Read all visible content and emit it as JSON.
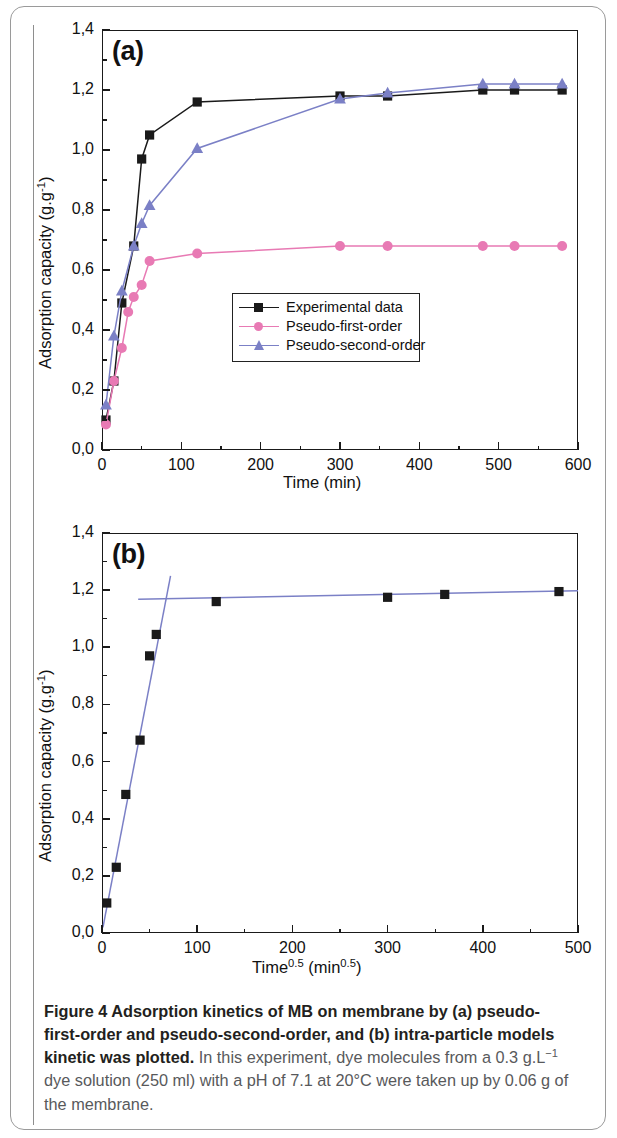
{
  "figure": {
    "caption_lead": "Figure 4 Adsorption kinetics of MB on membrane by (a) pseudo-first-order and pseudo-second-order, and (b) intra-particle models kinetic was plotted.",
    "caption_body_1": " In this experiment, dye molecules from a 0.3 g.L",
    "caption_sup_1": "−1",
    "caption_body_2": " dye solution (250 ml) with a pH of 7.1 at 20°C were taken up by 0.06 g of the membrane."
  },
  "colors": {
    "experimental": "#1a1a1a",
    "pseudo_first_order": "#e87ab4",
    "pseudo_second_order": "#7b80c6",
    "axis": "#1a1a1a",
    "caption_body": "#58595b",
    "caption_lead": "#231f20"
  },
  "chart_data": [
    {
      "type": "line",
      "panel": "(a)",
      "title": "",
      "xlabel": "Time (min)",
      "ylabel": "Adsorption capacity (g.g⁻¹)",
      "ylabel_base": "Adsorption capacity (g.g",
      "ylabel_sup": "-1",
      "ylabel_tail": ")",
      "xlim": [
        0,
        600
      ],
      "ylim": [
        0.0,
        1.4
      ],
      "xticks": [
        0,
        100,
        200,
        300,
        400,
        500,
        600
      ],
      "xticklabels": [
        "0",
        "100",
        "200",
        "300",
        "400",
        "500",
        "600"
      ],
      "yticks": [
        0.0,
        0.2,
        0.4,
        0.6,
        0.8,
        1.0,
        1.2,
        1.4
      ],
      "yticklabels": [
        "0,0",
        "0,2",
        "0,4",
        "0,6",
        "0,8",
        "1,0",
        "1,2",
        "1,4"
      ],
      "minor_ticks": true,
      "grid": false,
      "legend_position": "lower-center",
      "series": [
        {
          "name": "Experimental data",
          "marker": "square",
          "color": "#1a1a1a",
          "x": [
            5,
            15,
            25,
            40,
            50,
            60,
            120,
            300,
            360,
            480,
            520,
            580
          ],
          "y": [
            0.1,
            0.23,
            0.49,
            0.68,
            0.97,
            1.05,
            1.16,
            1.18,
            1.18,
            1.2,
            1.2,
            1.2
          ]
        },
        {
          "name": "Pseudo-first-order",
          "marker": "circle",
          "color": "#e87ab4",
          "x": [
            5,
            15,
            25,
            33,
            40,
            50,
            60,
            120,
            300,
            360,
            480,
            520,
            580
          ],
          "y": [
            0.085,
            0.23,
            0.34,
            0.46,
            0.51,
            0.55,
            0.63,
            0.655,
            0.68,
            0.68,
            0.68,
            0.68,
            0.68
          ]
        },
        {
          "name": "Pseudo-second-order",
          "marker": "triangle",
          "color": "#7b80c6",
          "x": [
            5,
            15,
            25,
            40,
            50,
            60,
            120,
            300,
            360,
            480,
            520,
            580
          ],
          "y": [
            0.15,
            0.38,
            0.53,
            0.68,
            0.755,
            0.815,
            1.005,
            1.17,
            1.19,
            1.22,
            1.22,
            1.22
          ]
        }
      ]
    },
    {
      "type": "scatter",
      "panel": "(b)",
      "title": "",
      "xlabel": "Time0.5 (min0.5)",
      "xlabel_base": "Time",
      "xlabel_sup1": "0.5",
      "xlabel_mid": " (min",
      "xlabel_sup2": "0.5",
      "xlabel_tail": ")",
      "ylabel": "Adsorption capacity (g.g⁻¹)",
      "ylabel_base": "Adsorption capacity (g.g",
      "ylabel_sup": "-1",
      "ylabel_tail": ")",
      "xlim": [
        0,
        500
      ],
      "ylim": [
        0.0,
        1.4
      ],
      "xticks": [
        0,
        100,
        200,
        300,
        400,
        500
      ],
      "xticklabels": [
        "0",
        "100",
        "200",
        "300",
        "400",
        "500"
      ],
      "yticks": [
        0.0,
        0.2,
        0.4,
        0.6,
        0.8,
        1.0,
        1.2,
        1.4
      ],
      "yticklabels": [
        "0,0",
        "0,2",
        "0,4",
        "0,6",
        "0,8",
        "1,0",
        "1,2",
        "1,4"
      ],
      "minor_ticks": true,
      "grid": false,
      "legend_position": "none",
      "series": [
        {
          "name": "Experimental data",
          "marker": "square",
          "color": "#1a1a1a",
          "x": [
            5,
            15,
            25,
            40,
            50,
            57,
            120,
            300,
            360,
            480
          ],
          "y": [
            0.105,
            0.23,
            0.485,
            0.675,
            0.97,
            1.045,
            1.16,
            1.175,
            1.185,
            1.195
          ]
        }
      ],
      "fit_lines": [
        {
          "name": "intra-particle-first-stage",
          "color": "#7b80c6",
          "x": [
            1,
            72
          ],
          "y": [
            0.02,
            1.25
          ]
        },
        {
          "name": "intra-particle-second-stage",
          "color": "#7b80c6",
          "x": [
            38,
            500
          ],
          "y": [
            1.168,
            1.198
          ]
        }
      ]
    }
  ]
}
